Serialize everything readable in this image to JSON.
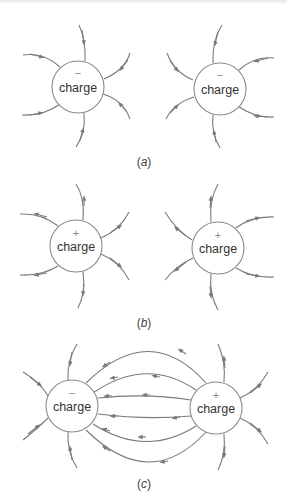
{
  "diagram": {
    "panels": [
      {
        "id": "a",
        "caption_letter": "a",
        "caption": "(a)",
        "charges": [
          {
            "label": "charge",
            "sign": "−",
            "type": "negative"
          },
          {
            "label": "charge",
            "sign": "−",
            "type": "negative"
          }
        ],
        "field_direction": "inward"
      },
      {
        "id": "b",
        "caption_letter": "b",
        "caption": "(b)",
        "charges": [
          {
            "label": "charge",
            "sign": "+",
            "type": "positive"
          },
          {
            "label": "charge",
            "sign": "+",
            "type": "positive"
          }
        ],
        "field_direction": "outward"
      },
      {
        "id": "c",
        "caption_letter": "c",
        "caption": "(c)",
        "charges": [
          {
            "label": "charge",
            "sign": "−",
            "type": "negative"
          },
          {
            "label": "charge",
            "sign": "+",
            "type": "positive"
          }
        ],
        "field_direction": "positive-to-negative"
      }
    ],
    "colors": {
      "line": "#7a7a7a",
      "circle": "#8a8a8a",
      "text": "#333333",
      "background": "#ffffff"
    }
  }
}
